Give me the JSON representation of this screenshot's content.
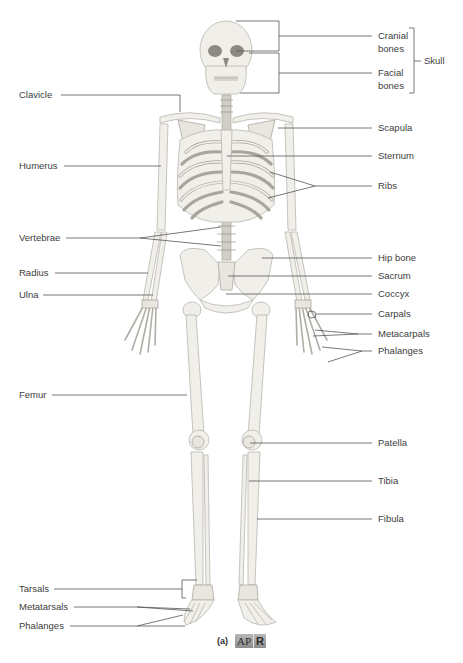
{
  "figure": {
    "caption_letter": "(a)",
    "badge": {
      "left": "AP",
      "right": "R"
    }
  },
  "labels": {
    "left": [
      {
        "id": "clavicle",
        "text": "Clavicle"
      },
      {
        "id": "humerus",
        "text": "Humerus"
      },
      {
        "id": "vertebrae",
        "text": "Vertebrae"
      },
      {
        "id": "radius",
        "text": "Radius"
      },
      {
        "id": "ulna",
        "text": "Ulna"
      },
      {
        "id": "femur",
        "text": "Femur"
      },
      {
        "id": "tarsals",
        "text": "Tarsals"
      },
      {
        "id": "metatarsals",
        "text": "Metatarsals"
      },
      {
        "id": "phalanges_foot",
        "text": "Phalanges"
      }
    ],
    "right": [
      {
        "id": "cranial",
        "line1": "Cranial",
        "line2": "bones"
      },
      {
        "id": "facial",
        "line1": "Facial",
        "line2": "bones"
      },
      {
        "id": "skull",
        "text": "Skull"
      },
      {
        "id": "scapula",
        "text": "Scapula"
      },
      {
        "id": "sternum",
        "text": "Sternum"
      },
      {
        "id": "ribs",
        "text": "Ribs"
      },
      {
        "id": "hip_bone",
        "text": "Hip bone"
      },
      {
        "id": "sacrum",
        "text": "Sacrum"
      },
      {
        "id": "coccyx",
        "text": "Coccyx"
      },
      {
        "id": "carpals",
        "text": "Carpals"
      },
      {
        "id": "metacarpals",
        "text": "Metacarpals"
      },
      {
        "id": "phalanges_hand",
        "text": "Phalanges"
      },
      {
        "id": "patella",
        "text": "Patella"
      },
      {
        "id": "tibia",
        "text": "Tibia"
      },
      {
        "id": "fibula",
        "text": "Fibula"
      }
    ]
  }
}
